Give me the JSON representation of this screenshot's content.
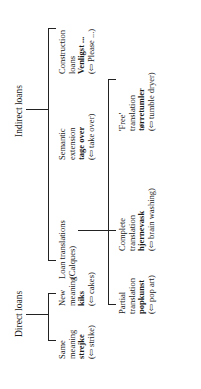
{
  "diagram": {
    "orientation": "rotated 90° counter-clockwise",
    "roots": [
      {
        "label": "Direct loans",
        "children": [
          {
            "lines": [
              "Same",
              "meaning"
            ],
            "example": "strejke",
            "gloss": "(⇦ strike)"
          },
          {
            "lines": [
              "New",
              "meaning"
            ],
            "example": "kiks",
            "gloss": "(⇦ cakes)"
          }
        ]
      },
      {
        "label": "Indirect loans",
        "children": [
          {
            "lines": [
              "Loan translations",
              "(Calques)"
            ],
            "children": [
              {
                "lines": [
                  "Partial",
                  "translation"
                ],
                "example": "popkunst",
                "gloss": "(⇦ pop art)"
              },
              {
                "lines": [
                  "Complete",
                  "translation"
                ],
                "example": "hjernevask",
                "gloss": "(⇦ brain washing)"
              },
              {
                "lines": [
                  "'Free'",
                  "translation"
                ],
                "example": "tørretumler",
                "gloss": "(⇦ tumble dryer)"
              }
            ]
          },
          {
            "lines": [
              "Semantic",
              "extension"
            ],
            "example": "tage over",
            "gloss": "(⇦ take over)"
          },
          {
            "lines": [
              "Construction",
              "loans"
            ],
            "example": "Venligst ...",
            "gloss": "(⇦ Please ...)"
          }
        ]
      }
    ]
  }
}
